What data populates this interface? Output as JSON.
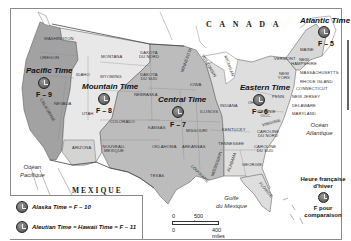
{
  "map": {
    "countries": {
      "canada": "C A N A D A",
      "mexico": "MEXIQUE"
    },
    "oceans": {
      "pacific": [
        "Océan",
        "Pacifique"
      ],
      "atlantic": [
        "Océan",
        "Atlantique"
      ],
      "gulf": [
        "Golfe",
        "du Mexique"
      ]
    },
    "zones": [
      {
        "name": "Pacific Time",
        "offset": "F – 9",
        "color": "#9c9c9c"
      },
      {
        "name": "Mountain Time",
        "offset": "F – 8",
        "color": "#e6e6e6"
      },
      {
        "name": "Central Time",
        "offset": "F – 7",
        "color": "#b9b9b9"
      },
      {
        "name": "Eastern Time",
        "offset": "F – 6",
        "color": "#dcdcdc"
      },
      {
        "name": "Atlantic Time",
        "offset": "F – 5",
        "color": "#f2f2f2"
      }
    ],
    "states": {
      "washington": "WASHINGTON",
      "oregon": "OREGON",
      "california": "CALIFORNIE",
      "nevada": "NEVADA",
      "idaho": "IDAHO",
      "montana": "MONTANA",
      "wyoming": "WYOMING",
      "utah": "UTAH",
      "arizona": "ARIZONA",
      "colorado": "COLORADO",
      "nouveau_mexique": "NOUVEAU- MEXIQUE",
      "dakota_nord": "DAKOTA DU NORD",
      "dakota_sud": "DAKOTA DU SUD",
      "nebraska": "NEBRASKA",
      "kansas": "KANSAS",
      "oklahoma": "OKLAHOMA",
      "texas": "TEXAS",
      "minnesota": "MINNESOTA",
      "iowa": "IOWA",
      "missouri": "MISSOURI",
      "arkansas": "ARKANSAS",
      "louisiane": "LOUISIANE",
      "wisconsin": "WISCONSIN",
      "illinois": "ILLINOIS",
      "michigan": "MICHIGAN",
      "indiana": "INDIANA",
      "ohio": "OHIO",
      "kentucky": "KENTUCKY",
      "tennessee": "TENNESSEE",
      "mississippi": "MISSISSIPPI",
      "alabama": "ALABAMA",
      "georgie": "GEORGIE",
      "floride": "FLORIDE",
      "caroline_sud": "CAROLINE DU SUD",
      "caroline_nord": "CAROLINE DU NORD",
      "virginie": "VIRGINIE",
      "virginie_occ": "VIRGINIE OCC.",
      "penn": "PENN.",
      "new_york": "NEW YORK",
      "vermont": "VERMONT",
      "new_hampshire": "NEW HAMPSHIRE",
      "maine": "MAINE",
      "massachusetts": "MASSACHUSETTS",
      "rhode_island": "RHODE ISLAND",
      "connecticut": "CONNECTICUT",
      "new_jersey": "NEW JERSEY",
      "delaware": "DELAWARE",
      "maryland": "MARYLAND"
    },
    "legend": {
      "alaska": "Alaska Time = F – 10",
      "aleutian": "Aleutian Time = Hawaii Time = F – 11"
    },
    "french_time": {
      "line1": "Heure française",
      "line2": "d'hiver",
      "line3": "F pour",
      "line4": "comparaison"
    },
    "scale": {
      "zero": "0",
      "km": "500 km",
      "miles": "400 miles"
    }
  }
}
